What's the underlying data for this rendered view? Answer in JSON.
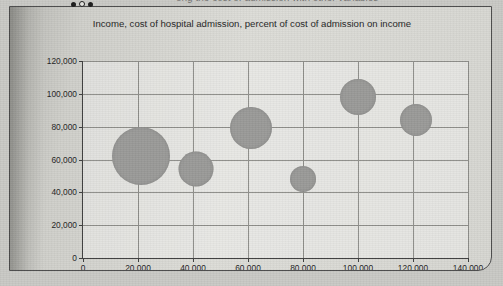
{
  "page": {
    "cut_off_caption": "ong the cost of admission with other variables",
    "dots": [
      "filled",
      "hollow",
      "filled"
    ]
  },
  "chart_data": {
    "type": "scatter",
    "title": "Income, cost of hospital admission, percent of cost of admission on income",
    "xlabel": "",
    "ylabel": "",
    "xlim": [
      0,
      140000
    ],
    "ylim": [
      0,
      120000
    ],
    "grid": true,
    "legend": "none",
    "x_ticks": [
      "0",
      "20,000",
      "40,000",
      "60,000",
      "80,000",
      "100,000",
      "120,000",
      "140,000"
    ],
    "y_ticks": [
      "0",
      "20,000",
      "40,000",
      "60,000",
      "80,000",
      "100,000",
      "120,000"
    ],
    "x_tick_values": [
      0,
      20000,
      40000,
      60000,
      80000,
      100000,
      120000,
      140000
    ],
    "y_tick_values": [
      0,
      20000,
      40000,
      60000,
      80000,
      100000,
      120000
    ],
    "marker_color": "#9a9a98",
    "points": [
      {
        "x": 21000,
        "y": 62000,
        "size": 58
      },
      {
        "x": 41000,
        "y": 54000,
        "size": 35
      },
      {
        "x": 61000,
        "y": 79000,
        "size": 42
      },
      {
        "x": 80000,
        "y": 48000,
        "size": 26
      },
      {
        "x": 100000,
        "y": 98000,
        "size": 36
      },
      {
        "x": 121000,
        "y": 84000,
        "size": 32
      }
    ]
  }
}
